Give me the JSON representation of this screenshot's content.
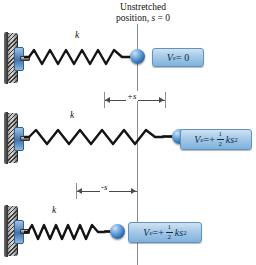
{
  "diagram": {
    "heading_line1": "Unstretched",
    "heading_line2_prefix": "position, ",
    "heading_line2_var": "s",
    "heading_line2_suffix": " = 0",
    "reference_label": "s = 0",
    "accent_color": "#7fb1dc",
    "box_border_color": "#5f93c4",
    "ball_color": "#3d7fc1",
    "spring_color": "#1a1a1a"
  },
  "rows": [
    {
      "id": "unstretched",
      "stiffness_label": "k",
      "equation": {
        "symbol": "V",
        "subscript": "e",
        "relation": " = 0",
        "sign": "",
        "fraction_num": "",
        "fraction_den": "",
        "term": "",
        "exponent": ""
      },
      "state": "unstretched"
    },
    {
      "id": "stretched",
      "stiffness_label": "k",
      "equation": {
        "symbol": "V",
        "subscript": "e",
        "relation": " = ",
        "sign": "+",
        "fraction_num": "1",
        "fraction_den": "2",
        "term": "ks",
        "exponent": "2"
      },
      "state": "stretched"
    },
    {
      "id": "compressed",
      "stiffness_label": "k",
      "equation": {
        "symbol": "V",
        "subscript": "e",
        "relation": " = ",
        "sign": "+",
        "fraction_num": "1",
        "fraction_den": "2",
        "term": "ks",
        "exponent": "2"
      },
      "state": "compressed"
    }
  ],
  "dimensions": [
    {
      "id": "positive-s",
      "label": "+s"
    },
    {
      "id": "negative-s",
      "label": "-s"
    }
  ]
}
